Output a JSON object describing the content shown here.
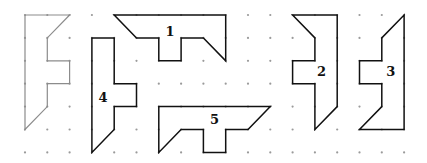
{
  "grid": {
    "origin_x": 25,
    "origin_y": 15,
    "step_x": 22.3,
    "step_y": 22.9,
    "cols": 18,
    "rows": 7,
    "dot_color": "#9a9a9a"
  },
  "reference_shape": {
    "name": "F-shape",
    "stroke": "#8c8c8c",
    "points": [
      [
        0,
        0
      ],
      [
        2,
        0
      ],
      [
        1,
        1
      ],
      [
        1,
        2
      ],
      [
        2,
        2
      ],
      [
        2,
        3
      ],
      [
        1,
        3
      ],
      [
        1,
        4
      ],
      [
        0,
        5
      ]
    ]
  },
  "shapes": [
    {
      "label": "1",
      "points": [
        [
          4,
          0
        ],
        [
          9,
          0
        ],
        [
          9,
          2
        ],
        [
          8,
          1
        ],
        [
          7,
          1
        ],
        [
          7,
          2
        ],
        [
          6,
          2
        ],
        [
          6,
          1
        ],
        [
          5,
          1
        ]
      ],
      "label_pos": [
        6.5,
        0.72
      ]
    },
    {
      "label": "2",
      "points": [
        [
          12,
          0
        ],
        [
          14,
          0
        ],
        [
          14,
          4
        ],
        [
          13,
          5
        ],
        [
          13,
          3
        ],
        [
          12,
          3
        ],
        [
          12,
          2
        ],
        [
          13,
          2
        ],
        [
          13,
          1
        ]
      ],
      "label_pos": [
        13.3,
        2.45
      ]
    },
    {
      "label": "3",
      "points": [
        [
          17,
          0
        ],
        [
          17,
          5
        ],
        [
          15,
          5
        ],
        [
          16,
          4
        ],
        [
          16,
          3
        ],
        [
          15,
          3
        ],
        [
          15,
          2
        ],
        [
          16,
          2
        ],
        [
          16,
          1
        ]
      ],
      "label_pos": [
        16.4,
        2.45
      ]
    },
    {
      "label": "4",
      "points": [
        [
          3,
          1
        ],
        [
          4,
          1
        ],
        [
          4,
          3
        ],
        [
          5,
          3
        ],
        [
          5,
          4
        ],
        [
          4,
          4
        ],
        [
          4,
          5
        ],
        [
          3,
          6
        ]
      ],
      "label_pos": [
        3.5,
        3.6
      ]
    },
    {
      "label": "5",
      "points": [
        [
          6,
          4
        ],
        [
          11,
          4
        ],
        [
          10,
          5
        ],
        [
          9,
          5
        ],
        [
          9,
          6
        ],
        [
          8,
          6
        ],
        [
          8,
          5
        ],
        [
          7,
          5
        ],
        [
          6,
          6
        ]
      ],
      "label_pos": [
        8.5,
        4.55
      ]
    }
  ],
  "shape_stroke": "#111111"
}
